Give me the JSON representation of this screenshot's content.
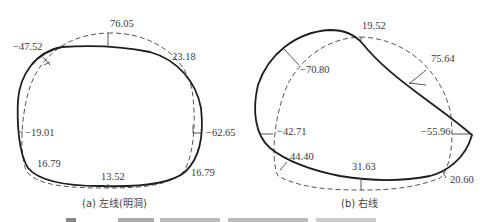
{
  "figure": {
    "caption_partial": "图 ... (caption truncated at bottom edge)"
  },
  "panels": [
    {
      "id": "a",
      "caption": "(a) 左线(明洞)",
      "labels": [
        {
          "text": "76.05",
          "pos": "top"
        },
        {
          "text": "−47.52",
          "pos": "top-left"
        },
        {
          "text": "23.18",
          "pos": "top-right"
        },
        {
          "text": "−19.01",
          "pos": "left"
        },
        {
          "text": "−62.65",
          "pos": "right"
        },
        {
          "text": "16.79",
          "pos": "bottom-left"
        },
        {
          "text": "13.52",
          "pos": "bottom"
        },
        {
          "text": "16.79",
          "pos": "bottom-right"
        }
      ]
    },
    {
      "id": "b",
      "caption": "(b) 右线",
      "labels": [
        {
          "text": "19.52",
          "pos": "top"
        },
        {
          "text": "−70.80",
          "pos": "top-left"
        },
        {
          "text": "75.64",
          "pos": "top-right"
        },
        {
          "text": "−42.71",
          "pos": "left"
        },
        {
          "text": "−55.96",
          "pos": "right"
        },
        {
          "text": "44.40",
          "pos": "bottom-left"
        },
        {
          "text": "31.63",
          "pos": "bottom"
        },
        {
          "text": "20.60",
          "pos": "bottom-right"
        }
      ]
    }
  ],
  "legend": {
    "solid_line": "deformed contour",
    "dashed_line": "original tunnel contour"
  }
}
